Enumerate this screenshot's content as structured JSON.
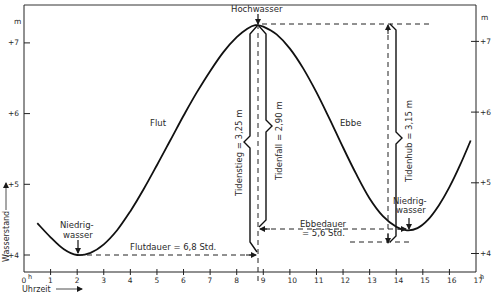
{
  "chart_data": {
    "type": "line",
    "title": "",
    "xlabel": "Uhrzeit",
    "ylabel": "Wasserstand",
    "x_unit": "h",
    "y_unit": "m",
    "xlim": [
      0,
      17
    ],
    "ylim": [
      3.75,
      7.55
    ],
    "x_ticks": [
      "0",
      "1",
      "2",
      "3",
      "4",
      "5",
      "6",
      "7",
      "8",
      "9",
      "10",
      "11",
      "12",
      "13",
      "14",
      "15",
      "16",
      "17"
    ],
    "y_ticks": [
      {
        "value": 4,
        "label": "+4"
      },
      {
        "value": 5,
        "label": "+5"
      },
      {
        "value": 6,
        "label": "+6"
      },
      {
        "value": 7,
        "label": "+7"
      }
    ],
    "series": [
      {
        "name": "Wasserstand",
        "points": [
          [
            0.5,
            4.45
          ],
          [
            1.0,
            4.25
          ],
          [
            1.5,
            4.08
          ],
          [
            2.0,
            4.0
          ],
          [
            2.5,
            4.03
          ],
          [
            3.0,
            4.15
          ],
          [
            3.5,
            4.35
          ],
          [
            4.0,
            4.62
          ],
          [
            4.5,
            4.93
          ],
          [
            5.0,
            5.27
          ],
          [
            5.5,
            5.62
          ],
          [
            6.0,
            5.97
          ],
          [
            6.5,
            6.3
          ],
          [
            7.0,
            6.6
          ],
          [
            7.5,
            6.87
          ],
          [
            8.0,
            7.08
          ],
          [
            8.4,
            7.2
          ],
          [
            8.7,
            7.25
          ],
          [
            9.0,
            7.23
          ],
          [
            9.5,
            7.12
          ],
          [
            10.0,
            6.92
          ],
          [
            10.5,
            6.64
          ],
          [
            11.0,
            6.3
          ],
          [
            11.5,
            5.92
          ],
          [
            12.0,
            5.52
          ],
          [
            12.5,
            5.14
          ],
          [
            13.0,
            4.8
          ],
          [
            13.5,
            4.55
          ],
          [
            14.0,
            4.4
          ],
          [
            14.4,
            4.35
          ],
          [
            14.8,
            4.38
          ],
          [
            15.2,
            4.5
          ],
          [
            15.6,
            4.7
          ],
          [
            16.0,
            4.96
          ],
          [
            16.4,
            5.27
          ],
          [
            16.8,
            5.62
          ]
        ]
      }
    ],
    "annotations": {
      "high_water": {
        "label": "Hochwasser",
        "x": 8.7,
        "y": 7.25
      },
      "low_water_1": {
        "label_line1": "Niedrig-",
        "label_line2": "wasser",
        "x": 2.0,
        "y": 4.0
      },
      "low_water_2": {
        "label_line1": "Niedrig-",
        "label_line2": "wasser",
        "x": 14.4,
        "y": 4.35
      },
      "flood_label": "Flut",
      "ebb_label": "Ebbe",
      "flood_duration": "Flutdauer = 6,8 Std.",
      "ebb_duration_line1": "Ebbedauer",
      "ebb_duration_line2": "= 5,6 Std.",
      "tidal_rise": "Tidenstieg = 3,25 m",
      "tidal_fall": "Tidenfall = 2,90 m",
      "tidal_range": "Tidenhub = 3,15 m"
    },
    "grid": false,
    "legend": "none"
  },
  "axes": {
    "y_unit_left": "m",
    "y_unit_right": "m",
    "x_origin_label": "0",
    "x_hour_suffix": "h",
    "xlabel": "Uhrzeit",
    "ylabel": "Wasserstand"
  }
}
